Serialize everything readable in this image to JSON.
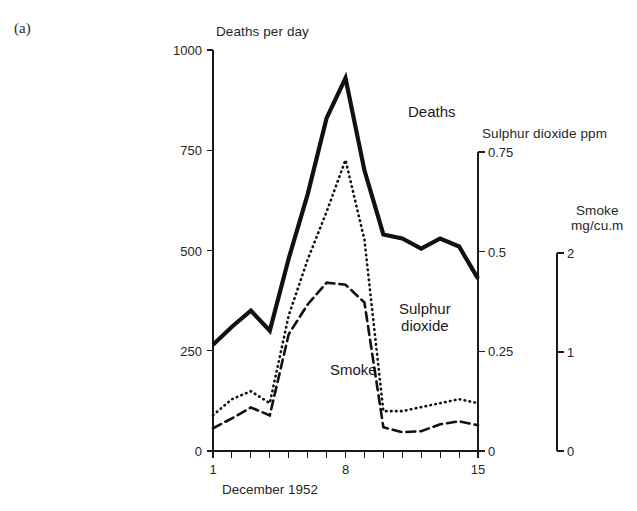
{
  "page": {
    "cropped_header_text": "",
    "panel_letter": "(a)"
  },
  "figure": {
    "x_axis_title": "December 1952",
    "left_axis_title": "Deaths per day",
    "right_axis_1_title": "Sulphur dioxide ppm",
    "right_axis_2_title_line1": "Smoke",
    "right_axis_2_title_line2": "mg/cu.m",
    "curve_labels": {
      "deaths": "Deaths",
      "sulphur_dioxide_line1": "Sulphur",
      "sulphur_dioxide_line2": "dioxide",
      "smoke": "Smoke"
    }
  },
  "chart_data": {
    "type": "line",
    "title": "",
    "subtitle": "",
    "xlabel": "December 1952",
    "grid": false,
    "legend": "inline-labels",
    "x": [
      1,
      2,
      3,
      4,
      5,
      6,
      7,
      8,
      9,
      10,
      11,
      12,
      13,
      14,
      15
    ],
    "x_tick_labels": [
      "1",
      "8",
      "15"
    ],
    "x_tick_label_values": [
      1,
      8,
      15
    ],
    "xlim": [
      1,
      15
    ],
    "axes": [
      {
        "id": "deaths",
        "position": "left",
        "label": "Deaths per day",
        "ylim": [
          0,
          1000
        ],
        "ticks": [
          0,
          250,
          500,
          750,
          1000
        ],
        "tick_labels": [
          "0",
          "250",
          "500",
          "750",
          "1000"
        ]
      },
      {
        "id": "sulphur_dioxide",
        "position": "right",
        "label": "Sulphur dioxide ppm",
        "ylim": [
          0,
          0.75
        ],
        "ticks": [
          0,
          0.25,
          0.5,
          0.75
        ],
        "tick_labels": [
          "0",
          "0.25",
          "0.5",
          "0.75"
        ]
      },
      {
        "id": "smoke",
        "position": "right-outer",
        "label": "Smoke mg/cu.m",
        "ylim": [
          0,
          2
        ],
        "ticks": [
          0,
          1,
          2
        ],
        "tick_labels": [
          "0",
          "1",
          "2"
        ]
      }
    ],
    "series": [
      {
        "name": "Deaths",
        "axis": "deaths",
        "unit": "deaths per day",
        "style": "solid-thick",
        "values": [
          265,
          310,
          350,
          300,
          480,
          640,
          830,
          930,
          700,
          540,
          530,
          505,
          530,
          510,
          430
        ]
      },
      {
        "name": "Sulphur dioxide",
        "axis": "sulphur_dioxide",
        "unit": "ppm",
        "style": "dotted",
        "values": [
          0.09,
          0.13,
          0.15,
          0.12,
          0.34,
          0.48,
          0.6,
          0.73,
          0.53,
          0.1,
          0.1,
          0.11,
          0.12,
          0.13,
          0.12
        ]
      },
      {
        "name": "Smoke",
        "axis": "smoke",
        "unit": "mg/cu.m",
        "style": "dashed",
        "values": [
          0.23,
          0.33,
          0.44,
          0.36,
          1.18,
          1.48,
          1.7,
          1.68,
          1.5,
          0.24,
          0.19,
          0.2,
          0.27,
          0.3,
          0.26
        ]
      }
    ]
  }
}
